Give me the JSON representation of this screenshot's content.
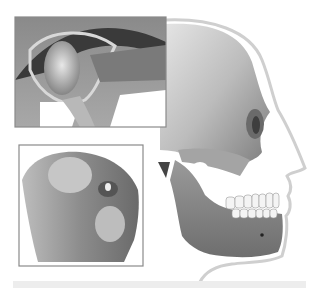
{
  "illustration": {
    "subject": "temporomandibular joint anatomy",
    "panels": [
      {
        "name": "skull-profile",
        "description": "side view of human skull within skin outline"
      },
      {
        "name": "joint-cross-section-inset",
        "description": "cross-section of jaw joint with disc"
      },
      {
        "name": "condyle-inset",
        "description": "close-up of mandibular condyle"
      }
    ]
  },
  "colors": {
    "background": "#ffffff",
    "inset_border": "#8a8a8a",
    "bone_light": "#d8d8d8",
    "bone_dark": "#4a4a4a",
    "skin_outline": "#c8c8c8",
    "teeth": "#f4f4f4",
    "bottom_bar": "#ededed"
  }
}
